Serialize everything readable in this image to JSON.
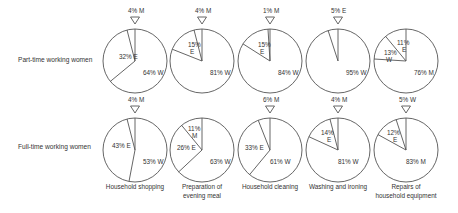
{
  "rows": [
    {
      "label": "Part-time working women"
    },
    {
      "label": "Full-time working women"
    }
  ],
  "columns": [
    {
      "label": [
        "Household shopping"
      ]
    },
    {
      "label": [
        "Preparation of",
        "evening meal"
      ]
    },
    {
      "label": [
        "Household cleaning"
      ]
    },
    {
      "label": [
        "Washing and ironing"
      ]
    },
    {
      "label": [
        "Repairs of",
        "household equipment"
      ]
    }
  ],
  "chart_data": {
    "type": "pie",
    "title": "",
    "legend": {
      "W": "Woman",
      "E": "Equal / shared",
      "M": "Man"
    },
    "rows": [
      "Part-time working women",
      "Full-time working women"
    ],
    "categories": [
      "Household shopping",
      "Preparation of evening meal",
      "Household cleaning",
      "Washing and ironing",
      "Repairs of household equipment"
    ],
    "pies": [
      [
        {
          "slices": [
            {
              "label": "W",
              "value": 64
            },
            {
              "label": "E",
              "value": 32
            },
            {
              "label": "M",
              "value": 4
            }
          ],
          "outside": "4% M",
          "texts": [
            {
              "t": "64% W",
              "dx": 8,
              "dy": 14
            },
            {
              "t": "32% E",
              "dx": -16,
              "dy": -2
            }
          ]
        },
        {
          "slices": [
            {
              "label": "W",
              "value": 81
            },
            {
              "label": "E",
              "value": 15
            },
            {
              "label": "M",
              "value": 4
            }
          ],
          "outside": "4% M",
          "texts": [
            {
              "t": "81% W",
              "dx": 8,
              "dy": 14
            },
            {
              "t": "15%",
              "dx": -14,
              "dy": -14
            },
            {
              "t": "E",
              "dx": -12,
              "dy": -7
            }
          ]
        },
        {
          "slices": [
            {
              "label": "W",
              "value": 84
            },
            {
              "label": "E",
              "value": 15
            },
            {
              "label": "M",
              "value": 1
            }
          ],
          "outside": "1% M",
          "texts": [
            {
              "t": "84% W",
              "dx": 8,
              "dy": 14
            },
            {
              "t": "15%",
              "dx": -12,
              "dy": -14
            },
            {
              "t": "E",
              "dx": -10,
              "dy": -7
            }
          ]
        },
        {
          "slices": [
            {
              "label": "W",
              "value": 95
            },
            {
              "label": "E",
              "value": 5
            }
          ],
          "outside": "5% E",
          "texts": [
            {
              "t": "95% W",
              "dx": 8,
              "dy": 14
            }
          ]
        },
        {
          "slices": [
            {
              "label": "M",
              "value": 76
            },
            {
              "label": "W",
              "value": 13
            },
            {
              "label": "E",
              "value": 11
            }
          ],
          "outside": "",
          "texts": [
            {
              "t": "76% M",
              "dx": 8,
              "dy": 14
            },
            {
              "t": "11%",
              "dx": -9,
              "dy": -16
            },
            {
              "t": "E",
              "dx": -4,
              "dy": -9
            },
            {
              "t": "13%",
              "dx": -22,
              "dy": -6
            },
            {
              "t": "W",
              "dx": -20,
              "dy": 1
            }
          ]
        }
      ],
      [
        {
          "slices": [
            {
              "label": "W",
              "value": 53
            },
            {
              "label": "E",
              "value": 43
            },
            {
              "label": "M",
              "value": 4
            }
          ],
          "outside": "4% M",
          "texts": [
            {
              "t": "53% W",
              "dx": 8,
              "dy": 14
            },
            {
              "t": "43% E",
              "dx": -23,
              "dy": -2
            }
          ]
        },
        {
          "slices": [
            {
              "label": "W",
              "value": 63
            },
            {
              "label": "E",
              "value": 26
            },
            {
              "label": "M",
              "value": 11
            }
          ],
          "outside": "",
          "texts": [
            {
              "t": "63% W",
              "dx": 8,
              "dy": 14
            },
            {
              "t": "26% E",
              "dx": -25,
              "dy": 0
            },
            {
              "t": "11%",
              "dx": -14,
              "dy": -19
            },
            {
              "t": "M",
              "dx": -10,
              "dy": -12
            }
          ]
        },
        {
          "slices": [
            {
              "label": "W",
              "value": 61
            },
            {
              "label": "E",
              "value": 33
            },
            {
              "label": "M",
              "value": 6
            }
          ],
          "outside": "6% M",
          "texts": [
            {
              "t": "61% W",
              "dx": 0,
              "dy": 14
            },
            {
              "t": "33% E",
              "dx": -25,
              "dy": 0
            }
          ]
        },
        {
          "slices": [
            {
              "label": "W",
              "value": 81
            },
            {
              "label": "E",
              "value": 14
            },
            {
              "label": "M",
              "value": 4
            }
          ],
          "outside": "4% M",
          "texts": [
            {
              "t": "81% W",
              "dx": 0,
              "dy": 14
            },
            {
              "t": "14%",
              "dx": -17,
              "dy": -15
            },
            {
              "t": "E",
              "dx": -11,
              "dy": -8
            }
          ]
        },
        {
          "slices": [
            {
              "label": "M",
              "value": 83
            },
            {
              "label": "E",
              "value": 12
            },
            {
              "label": "W",
              "value": 5
            }
          ],
          "outside": "5% W",
          "texts": [
            {
              "t": "83% M",
              "dx": 0,
              "dy": 14
            },
            {
              "t": "12%",
              "dx": -19,
              "dy": -15
            },
            {
              "t": "E",
              "dx": -13,
              "dy": -8
            }
          ]
        }
      ]
    ],
    "layout": {
      "centers_x": [
        135,
        202,
        270,
        338,
        406
      ],
      "centers_y": [
        61,
        150
      ],
      "radius": 32
    }
  }
}
